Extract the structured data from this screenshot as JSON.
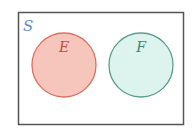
{
  "diagram": {
    "type": "venn",
    "universe": {
      "label": "S",
      "label_color": "#5a8fd0",
      "border_color": "#555555"
    },
    "sets": [
      {
        "label": "E",
        "fill": "#f6c6bd",
        "stroke": "#e0705f",
        "label_color": "#c0503f"
      },
      {
        "label": "F",
        "fill": "#dcf3ee",
        "stroke": "#5a9e8f",
        "label_color": "#3f8575"
      }
    ],
    "relationship": "disjoint"
  }
}
